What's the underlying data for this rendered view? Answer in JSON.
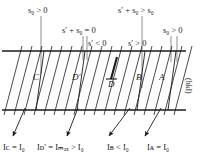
{
  "figure": {
    "type": "diffraction-band-diagram",
    "background": "#ffffff",
    "line_color": "#1a1a1a",
    "leader_color": "#8c8c8c",
    "width": 204,
    "height": 168
  },
  "top_labels": [
    {
      "id": "s0-left",
      "text": "s₀ > 0",
      "x": 28,
      "y": 6
    },
    {
      "id": "sp-plus-s0",
      "text": "s′ + s₀ = 0",
      "x": 62,
      "y": 26
    },
    {
      "id": "sp-plus-gt",
      "text": "s′ + s₀ > s₀",
      "x": 118,
      "y": 6
    },
    {
      "id": "s0-right",
      "text": "s₀ > 0",
      "x": 163,
      "y": 26
    }
  ],
  "mid_labels": [
    {
      "id": "sp-lt-0",
      "text": "s′ < 0",
      "x": 88,
      "y": 39
    },
    {
      "id": "sp-gt-0",
      "text": "s′ > 0",
      "x": 128,
      "y": 39
    }
  ],
  "band_letters": [
    {
      "id": "letter-C",
      "text": "C",
      "x": 33,
      "y": 77
    },
    {
      "id": "letter-Dp",
      "text": "D′",
      "x": 72,
      "y": 77
    },
    {
      "id": "letter-D",
      "text": "D",
      "x": 110,
      "y": 82
    },
    {
      "id": "letter-B",
      "text": "B",
      "x": 136,
      "y": 77
    },
    {
      "id": "letter-A",
      "text": "A",
      "x": 159,
      "y": 77
    }
  ],
  "bottom_labels": [
    {
      "id": "I-C",
      "text": "Iᴄ = I₀",
      "x": 4,
      "y": 145
    },
    {
      "id": "I-Dp",
      "text": "Iᴅ′ = Iₘₐₓ > I₀",
      "x": 38,
      "y": 145
    },
    {
      "id": "I-B",
      "text": "Iʙ < I₀",
      "x": 107,
      "y": 145
    },
    {
      "id": "I-A",
      "text": "Iᴀ = I₀",
      "x": 147,
      "y": 145
    }
  ],
  "side_label": {
    "id": "hkl",
    "text": "(hkl)",
    "x": 191,
    "y": 82
  },
  "band": {
    "top_line_y": 51,
    "bottom_line_y": 110,
    "left_x": 2,
    "right_x": 186
  }
}
